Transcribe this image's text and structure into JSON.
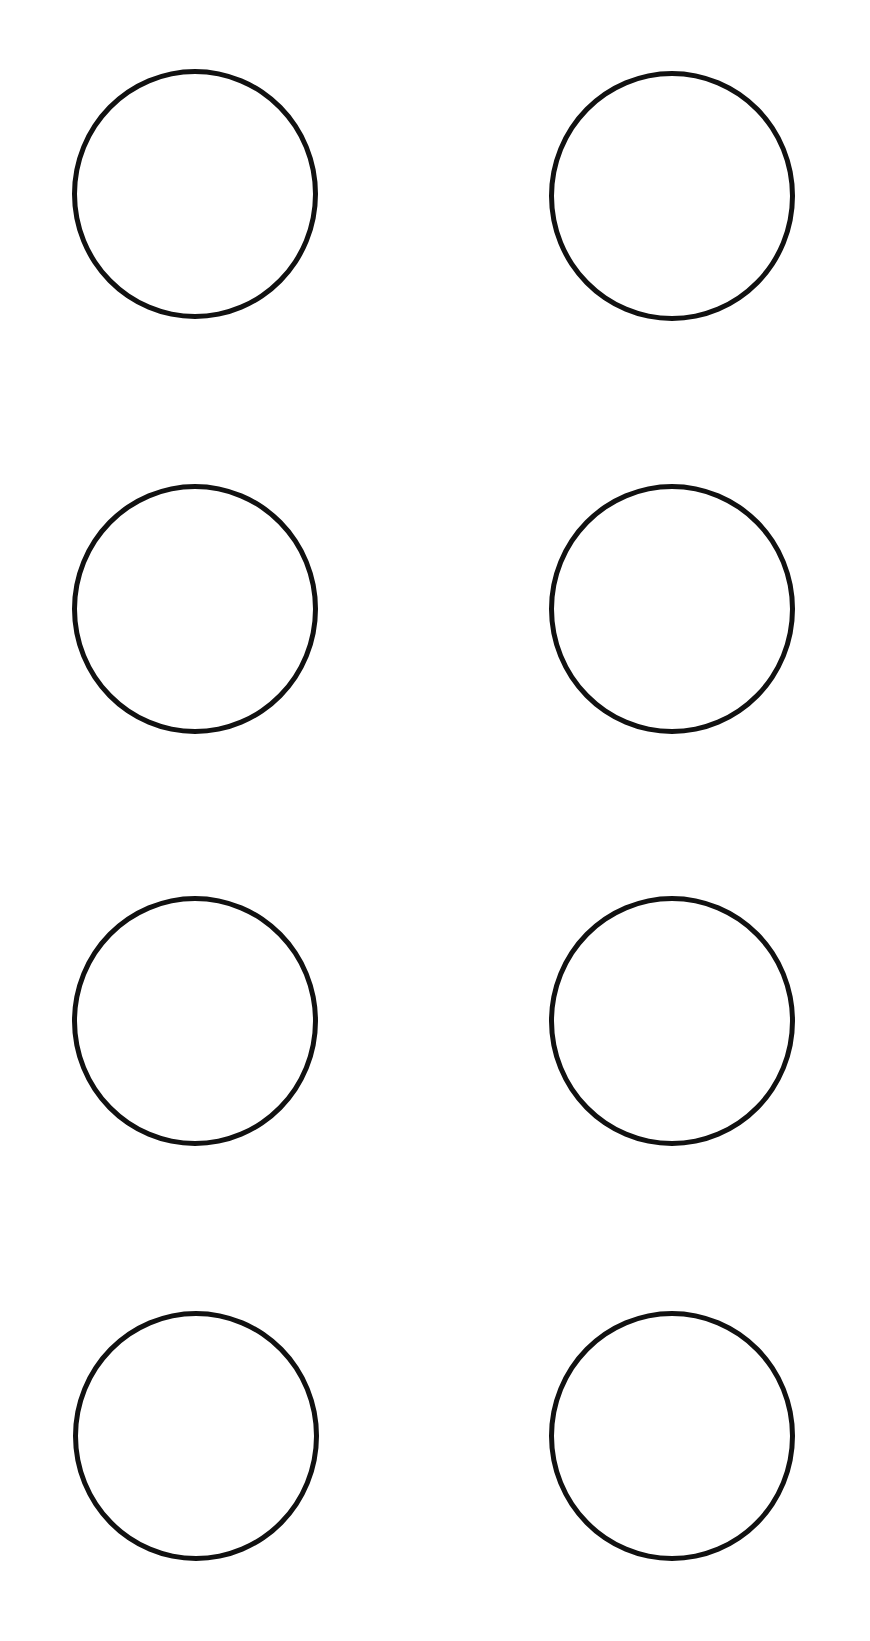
{
  "header": {
    "cut_off_title": ""
  },
  "colors": {
    "background": "#ffffff",
    "stroke": "#111111"
  },
  "grid": {
    "rows": 4,
    "columns": 2
  },
  "circles": [
    {
      "row": 1,
      "col": 1
    },
    {
      "row": 1,
      "col": 2
    },
    {
      "row": 2,
      "col": 1
    },
    {
      "row": 2,
      "col": 2
    },
    {
      "row": 3,
      "col": 1
    },
    {
      "row": 3,
      "col": 2
    },
    {
      "row": 4,
      "col": 1
    },
    {
      "row": 4,
      "col": 2
    }
  ]
}
